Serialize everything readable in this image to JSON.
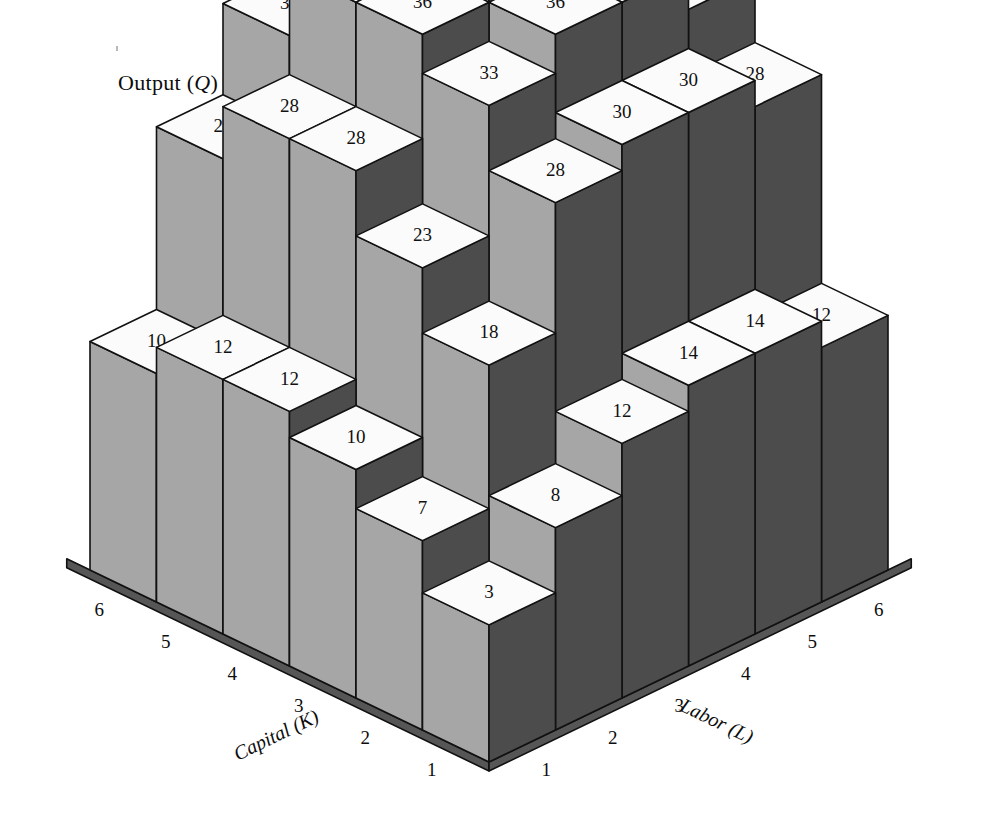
{
  "figure": {
    "vertical_axis_label": "Output (Q)",
    "x_axis_title": "Capital (K)",
    "y_axis_title": "Labor (L)",
    "capital_ticks": [
      "6",
      "5",
      "4",
      "3",
      "2",
      "1"
    ],
    "labor_ticks": [
      "1",
      "2",
      "3",
      "4",
      "5",
      "6"
    ]
  },
  "colors": {
    "top_face": "#fbfbfb",
    "left_face": "#a6a6a6",
    "right_face": "#4c4c4c",
    "outline": "#111111",
    "floor_edge": "#565656",
    "text": "#111111",
    "background": "#ffffff"
  },
  "chart_data": {
    "type": "bar",
    "title": "Output (Q)",
    "xlabel": "Capital (K)",
    "ylabel": "Labor (L)",
    "zlabel": "Output (Q)",
    "projection": "3d-isometric-bars",
    "grid": false,
    "legend": false,
    "capital_axis": [
      6,
      5,
      4,
      3,
      2,
      1
    ],
    "labor_axis": [
      1,
      2,
      3,
      4,
      5,
      6
    ],
    "zlim": [
      0,
      42
    ],
    "matrix_row_order": "capital 6 -> 1",
    "matrix_col_order": "labor 1 -> 6",
    "values": [
      [
        10,
        24,
        31,
        36,
        40,
        39
      ],
      [
        12,
        28,
        36,
        40,
        42,
        40
      ],
      [
        12,
        28,
        36,
        40,
        40,
        36
      ],
      [
        10,
        23,
        33,
        36,
        36,
        33
      ],
      [
        7,
        18,
        28,
        30,
        30,
        28
      ],
      [
        3,
        8,
        12,
        14,
        14,
        12
      ]
    ],
    "series": [
      {
        "name": "K = 6",
        "capital": 6,
        "labor": [
          1,
          2,
          3,
          4,
          5,
          6
        ],
        "values": [
          10,
          24,
          31,
          36,
          40,
          39
        ]
      },
      {
        "name": "K = 5",
        "capital": 5,
        "labor": [
          1,
          2,
          3,
          4,
          5,
          6
        ],
        "values": [
          12,
          28,
          36,
          40,
          42,
          40
        ]
      },
      {
        "name": "K = 4",
        "capital": 4,
        "labor": [
          1,
          2,
          3,
          4,
          5,
          6
        ],
        "values": [
          12,
          28,
          36,
          40,
          40,
          36
        ]
      },
      {
        "name": "K = 3",
        "capital": 3,
        "labor": [
          1,
          2,
          3,
          4,
          5,
          6
        ],
        "values": [
          10,
          23,
          33,
          36,
          36,
          33
        ]
      },
      {
        "name": "K = 2",
        "capital": 2,
        "labor": [
          1,
          2,
          3,
          4,
          5,
          6
        ],
        "values": [
          7,
          18,
          28,
          30,
          30,
          28
        ]
      },
      {
        "name": "K = 1",
        "capital": 1,
        "labor": [
          1,
          2,
          3,
          4,
          5,
          6
        ],
        "values": [
          3,
          8,
          12,
          14,
          14,
          12
        ]
      }
    ],
    "max_value": 42,
    "max_cell": {
      "capital": 5,
      "labor": 5,
      "value": 42
    }
  }
}
